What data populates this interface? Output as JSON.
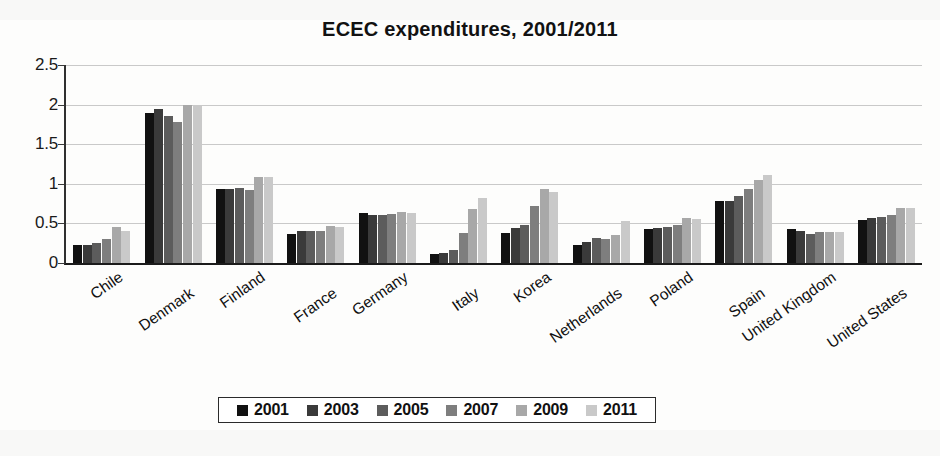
{
  "chart_data": {
    "type": "bar",
    "title": "ECEC expenditures, 2001/2011",
    "xlabel": "",
    "ylabel": "",
    "ylim": [
      0,
      2.5
    ],
    "yticks": [
      "0",
      "0.5",
      "1",
      "1.5",
      "2",
      "2.5"
    ],
    "ytick_values": [
      0,
      0.5,
      1,
      1.5,
      2,
      2.5
    ],
    "grid": true,
    "legend_position": "bottom",
    "categories": [
      "Chile",
      "Denmark",
      "Finland",
      "France",
      "Germany",
      "Italy",
      "Korea",
      "Netherlands",
      "Poland",
      "Spain",
      "United Kingdom",
      "United States"
    ],
    "series": [
      {
        "name": "2001",
        "color": "#111111",
        "values": [
          0.23,
          1.9,
          0.93,
          0.37,
          0.63,
          0.12,
          0.38,
          0.23,
          0.43,
          0.78,
          0.43,
          0.54
        ]
      },
      {
        "name": "2003",
        "color": "#3a3a3a",
        "values": [
          0.23,
          1.95,
          0.93,
          0.4,
          0.6,
          0.13,
          0.44,
          0.27,
          0.44,
          0.78,
          0.4,
          0.57
        ]
      },
      {
        "name": "2005",
        "color": "#5c5c5c",
        "values": [
          0.25,
          1.85,
          0.95,
          0.41,
          0.6,
          0.16,
          0.48,
          0.32,
          0.45,
          0.84,
          0.37,
          0.58
        ]
      },
      {
        "name": "2007",
        "color": "#7e7e7e",
        "values": [
          0.3,
          1.78,
          0.92,
          0.41,
          0.62,
          0.38,
          0.72,
          0.3,
          0.48,
          0.93,
          0.39,
          0.61
        ]
      },
      {
        "name": "2009",
        "color": "#a8a8a8",
        "values": [
          0.45,
          2.0,
          1.08,
          0.47,
          0.65,
          0.68,
          0.93,
          0.35,
          0.57,
          1.05,
          0.39,
          0.7
        ]
      },
      {
        "name": "2011",
        "color": "#c9c9c9",
        "values": [
          0.41,
          2.0,
          1.09,
          0.45,
          0.63,
          0.82,
          0.9,
          0.53,
          0.56,
          1.11,
          0.39,
          0.7
        ]
      }
    ]
  }
}
